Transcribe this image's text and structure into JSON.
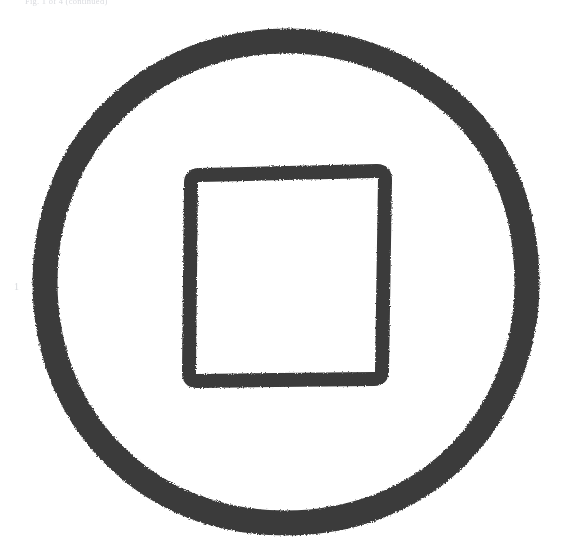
{
  "page": {
    "width": 568,
    "height": 554,
    "background_color": "#ffffff",
    "ink_color": "#3a3a3a",
    "medium": "scanned-printed-page"
  },
  "header": {
    "running_text": "Fig. 1 of 4 (continued)",
    "legible": false,
    "note": "faint grey, clipped by top edge of scan"
  },
  "margin": {
    "number": "1"
  },
  "figure": {
    "name": "square-within-a-circle",
    "stroke_color": "#3a3a3a",
    "edge_quality": "ragged hand-drawn / brush",
    "shapes": [
      {
        "name": "outer-circle",
        "type": "circle",
        "center_x": 286,
        "center_y": 282,
        "radius": 241,
        "stroke_width": 25
      },
      {
        "name": "inner-square",
        "type": "rect",
        "x": 190,
        "y": 173,
        "width": 193,
        "height": 207,
        "stroke_width": 14,
        "corner_radius": 9,
        "rotation_deg": -1.2
      }
    ]
  }
}
